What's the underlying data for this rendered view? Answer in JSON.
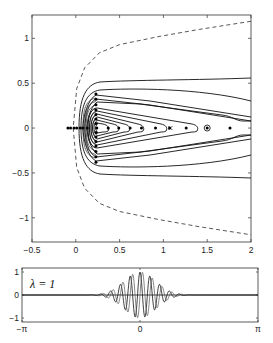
{
  "chart_data": [
    {
      "type": "line",
      "title": "",
      "xlabel": "",
      "ylabel": "",
      "xlim": [
        -0.5,
        2
      ],
      "ylim": [
        -1.27,
        1.26
      ],
      "xticks": [
        "-0.5",
        "0",
        "0.5",
        "1",
        "1.5",
        "2"
      ],
      "yticks": [
        "1",
        "0.5",
        "0",
        "-0.5",
        "-1"
      ],
      "grid": false,
      "series": [
        {
          "name": "dashed-boundary",
          "style": "dashed",
          "x": [
            2.0,
            1.41,
            0.95,
            0.5,
            0.27,
            0.1,
            0.01,
            -0.03,
            0.01,
            0.1,
            0.27,
            0.5,
            0.95,
            1.41,
            2.0
          ],
          "y": [
            1.19,
            1.1,
            1.02,
            0.93,
            0.84,
            0.67,
            0.44,
            0,
            -0.44,
            -0.67,
            -0.84,
            -0.93,
            -1.02,
            -1.1,
            -1.19
          ]
        },
        {
          "name": "contours",
          "style": "solid",
          "description": "nested level curves opening to the right, converging toward x≈0.2 along y=0"
        },
        {
          "name": "eigenvalues-real-axis",
          "style": "markers",
          "x": [
            -0.09,
            -0.06,
            -0.02,
            0.01,
            0.05,
            0.08,
            0.13,
            0.24,
            0.37,
            0.49,
            0.62,
            0.75,
            0.91,
            1.07,
            1.26,
            1.5,
            1.76
          ],
          "y": [
            0,
            0,
            0,
            0,
            0,
            0,
            0,
            0,
            0,
            0,
            0,
            0,
            0,
            0,
            0,
            0,
            0
          ]
        },
        {
          "name": "eigenvalues-vertical",
          "style": "markers",
          "x": [
            0.23,
            0.23,
            0.23,
            0.23,
            0.23,
            0.23,
            0.23,
            0.23,
            0.23,
            0.23,
            0.23,
            0.23,
            0.23,
            0.23
          ],
          "y": [
            0.38,
            0.32,
            0.26,
            0.2,
            0.15,
            0.1,
            0.05,
            -0.05,
            -0.1,
            -0.15,
            -0.2,
            -0.26,
            -0.32,
            -0.38
          ]
        },
        {
          "name": "circled-marker",
          "x": [
            1.5
          ],
          "y": [
            0
          ]
        },
        {
          "name": "cross-marker",
          "x": [
            1.08
          ],
          "y": [
            0
          ]
        }
      ]
    },
    {
      "type": "line",
      "title": "",
      "annotation": "λ = 1",
      "xlim": [
        "-π",
        "π"
      ],
      "ylim": [
        -1.2,
        1.2
      ],
      "xticks": [
        "-π",
        "0",
        "π"
      ],
      "yticks": [
        "1",
        "0",
        "-1"
      ],
      "series": [
        {
          "name": "wave-packet",
          "description": "oscillating Gaussian-enveloped wave packet centered at 0, amplitude 1, support about ±1.1"
        }
      ]
    }
  ],
  "labels": {
    "lambda": "λ = 1"
  }
}
